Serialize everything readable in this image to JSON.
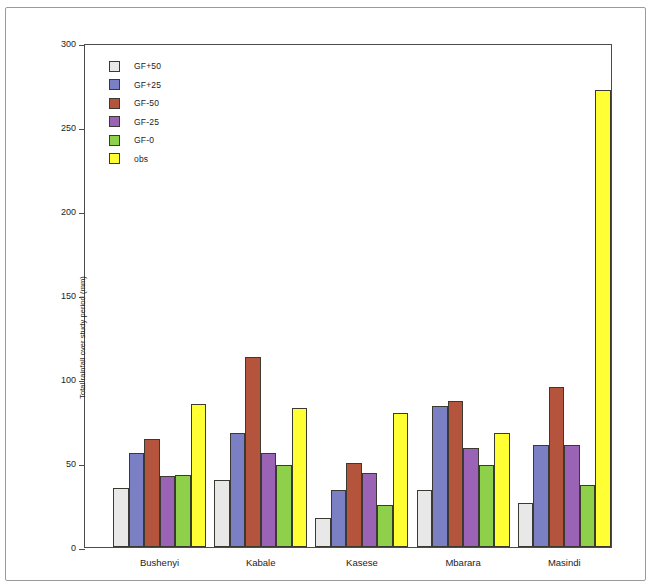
{
  "chart_data": {
    "type": "bar",
    "title": "",
    "xlabel": "",
    "ylabel": "Total rainfall over study period (mm)",
    "ylim": [
      0,
      300
    ],
    "yticks": [
      0,
      50,
      100,
      150,
      200,
      250,
      300
    ],
    "grid": false,
    "legend_position": "top-left",
    "categories": [
      "Bushenyi",
      "Kabale",
      "Kasese",
      "Mbarara",
      "Masindi"
    ],
    "series": [
      {
        "name": "GF+50",
        "color": "#e8e8e8",
        "values": [
          35,
          40,
          17,
          34,
          26
        ]
      },
      {
        "name": "GF+25",
        "color": "#7b7fc4",
        "values": [
          56,
          68,
          34,
          84,
          61
        ]
      },
      {
        "name": "GF-50",
        "color": "#b5543c",
        "values": [
          64,
          113,
          50,
          87,
          95
        ]
      },
      {
        "name": "GF-25",
        "color": "#9b63b5",
        "values": [
          42,
          56,
          44,
          59,
          61
        ]
      },
      {
        "name": "GF-0",
        "color": "#8ed04a",
        "values": [
          43,
          49,
          25,
          49,
          37
        ]
      },
      {
        "name": "obs",
        "color": "#ffff33",
        "values": [
          85,
          83,
          80,
          68,
          272
        ]
      }
    ]
  },
  "axis": {
    "tick_labels": [
      "300",
      "250",
      "200",
      "150",
      "100",
      "50",
      "0"
    ]
  }
}
